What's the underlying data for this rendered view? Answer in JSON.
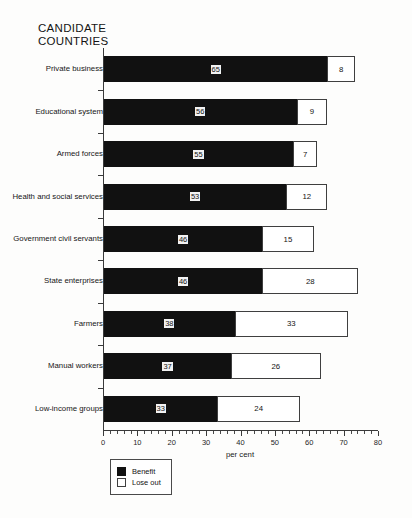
{
  "title": "CANDIDATE\nCOUNTRIES",
  "legend": {
    "items": [
      {
        "label": "Benefit",
        "swatch": "black-square-icon",
        "color": "#111111"
      },
      {
        "label": "Lose out",
        "swatch": "white-square-icon",
        "color": "#ffffff"
      }
    ]
  },
  "axis": {
    "x_title": "per cent",
    "x_ticks": [
      "0",
      "10",
      "20",
      "30",
      "40",
      "50",
      "60",
      "70",
      "80"
    ]
  },
  "chart_data": {
    "type": "bar",
    "orientation": "horizontal",
    "stacked": true,
    "title": "CANDIDATE COUNTRIES",
    "xlabel": "per cent",
    "ylabel": "",
    "xlim": [
      0,
      80
    ],
    "xticks": [
      0,
      10,
      20,
      30,
      40,
      50,
      60,
      70,
      80
    ],
    "minor_tick_step": 2,
    "grid": false,
    "legend_position": "bottom-left",
    "categories": [
      "Private business",
      "Educational system",
      "Armed forces",
      "Health and social services",
      "Government civil servants",
      "State enterprises",
      "Farmers",
      "Manual workers",
      "Low-income groups"
    ],
    "series": [
      {
        "name": "Benefit",
        "color": "#111111",
        "values": [
          65,
          56,
          55,
          53,
          46,
          46,
          38,
          37,
          33
        ]
      },
      {
        "name": "Lose out",
        "color": "#ffffff",
        "values": [
          8,
          9,
          7,
          12,
          15,
          28,
          33,
          26,
          24
        ]
      }
    ]
  }
}
